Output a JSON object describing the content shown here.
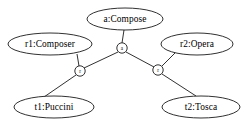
{
  "diagram": {
    "type": "object-graph",
    "background_color": "#ffffff",
    "stroke_color": "#1a1a1a",
    "nodes": [
      {
        "id": "a-compose",
        "label": "a:Compose",
        "shape": "ellipse",
        "cx": 125,
        "cy": 19,
        "rx": 38,
        "ry": 11
      },
      {
        "id": "r1-composer",
        "label": "r1:Composer",
        "shape": "ellipse",
        "cx": 50,
        "cy": 44,
        "rx": 42,
        "ry": 11
      },
      {
        "id": "r2-opera",
        "label": "r2:Opera",
        "shape": "ellipse",
        "cx": 197,
        "cy": 44,
        "rx": 36,
        "ry": 11
      },
      {
        "id": "t1-puccini",
        "label": "t1:Puccini",
        "shape": "ellipse",
        "cx": 54,
        "cy": 107,
        "rx": 40,
        "ry": 11
      },
      {
        "id": "t2-tosca",
        "label": "t2:Tosca",
        "shape": "ellipse",
        "cx": 201,
        "cy": 107,
        "rx": 39,
        "ry": 11
      }
    ],
    "connectors": [
      {
        "id": "connector-a",
        "label": "a",
        "shape": "circle",
        "cx": 122,
        "cy": 48,
        "r": 5.2
      },
      {
        "id": "connector-r-left",
        "label": "r",
        "shape": "circle",
        "cx": 80,
        "cy": 71,
        "r": 5.2
      },
      {
        "id": "connector-r-right",
        "label": "r",
        "shape": "circle",
        "cx": 158,
        "cy": 70,
        "r": 5.2
      }
    ],
    "edges": [
      {
        "id": "edge-compose-to-a",
        "from": "a-compose",
        "to": "connector-a",
        "x1": 124,
        "y1": 30,
        "x2": 122,
        "y2": 43
      },
      {
        "id": "edge-a-to-rleft",
        "from": "connector-a",
        "to": "connector-r-left",
        "x1": 118,
        "y1": 52,
        "x2": 84,
        "y2": 68
      },
      {
        "id": "edge-a-to-rright",
        "from": "connector-a",
        "to": "connector-r-right",
        "x1": 126,
        "y1": 52,
        "x2": 154,
        "y2": 67
      },
      {
        "id": "edge-composer-to-r",
        "from": "r1-composer",
        "to": "connector-r-left",
        "x1": 77,
        "y1": 54,
        "x2": 79,
        "y2": 66
      },
      {
        "id": "edge-opera-to-r",
        "from": "r2-opera",
        "to": "connector-r-right",
        "x1": 175,
        "y1": 53,
        "x2": 162,
        "y2": 66
      },
      {
        "id": "edge-rleft-to-puccini",
        "from": "connector-r-left",
        "to": "t1-puccini",
        "x1": 76,
        "y1": 75,
        "x2": 44,
        "y2": 97
      },
      {
        "id": "edge-rright-to-tosca",
        "from": "connector-r-right",
        "to": "t2-tosca",
        "x1": 162,
        "y1": 74,
        "x2": 196,
        "y2": 96
      }
    ]
  }
}
